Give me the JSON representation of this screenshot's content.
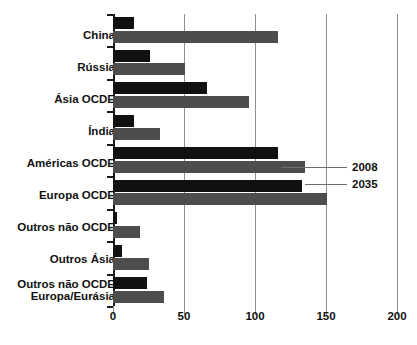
{
  "chart_data": {
    "type": "bar",
    "orientation": "horizontal",
    "title": "",
    "xlabel": "",
    "ylabel": "",
    "xlim": [
      0,
      200
    ],
    "xticks": [
      0,
      50,
      100,
      150,
      200
    ],
    "grid": true,
    "legend_position": "annotation-right",
    "categories": [
      "China",
      "Rússia",
      "Ásia OCDE",
      "Índia",
      "Américas OCDE",
      "Europa OCDE",
      "Outros não OCDE",
      "Outros Ásia",
      "Outros não OCDE\nEuropa/Eurásia"
    ],
    "series": [
      {
        "name": "2008",
        "color": "#111111",
        "values": [
          15,
          26,
          66,
          15,
          116,
          133,
          3,
          6,
          24
        ]
      },
      {
        "name": "2035",
        "color": "#4d4d4d",
        "values": [
          116,
          51,
          96,
          33,
          135,
          151,
          19,
          25,
          36
        ]
      }
    ],
    "annotations": [
      {
        "text": "2008",
        "series": "2008",
        "category": "Américas OCDE"
      },
      {
        "text": "2035",
        "series": "2035",
        "category": "Américas OCDE"
      }
    ]
  }
}
